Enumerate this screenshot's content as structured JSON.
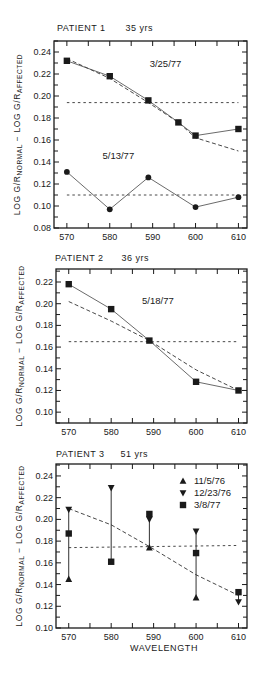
{
  "chart_data": [
    {
      "type": "line",
      "title": "PATIENT 1   35 yrs",
      "xlabel": "",
      "ylabel": "LOG G/R NORMAL − LOG G/R AFFECTED",
      "xlim": [
        567,
        612
      ],
      "ylim": [
        0.08,
        0.25
      ],
      "x_ticks": [
        570,
        580,
        590,
        600,
        610
      ],
      "y_ticks": [
        0.08,
        0.1,
        0.12,
        0.14,
        0.16,
        0.18,
        0.2,
        0.22,
        0.24
      ],
      "y_tick_labels": [
        "0.08",
        "0.10",
        "0.12",
        "0.14",
        "0.16",
        "0.18",
        "0.20",
        "0.22",
        "0.24"
      ],
      "series": [
        {
          "name": "3/25/77",
          "marker": "square",
          "x": [
            570,
            580,
            589,
            596,
            600,
            610
          ],
          "values": [
            0.232,
            0.218,
            0.196,
            0.176,
            0.164,
            0.17
          ]
        },
        {
          "name": "5/13/77",
          "marker": "circle",
          "x": [
            570,
            580,
            589,
            600,
            610
          ],
          "values": [
            0.131,
            0.097,
            0.126,
            0.099,
            0.108
          ]
        }
      ],
      "fit_lines": [
        {
          "style": "dashed",
          "x": [
            570,
            580,
            589,
            596,
            600,
            610
          ],
          "values": [
            0.234,
            0.216,
            0.194,
            0.176,
            0.162,
            0.15
          ]
        },
        {
          "style": "dotted-horizontal",
          "x": [
            570,
            610
          ],
          "values": [
            0.194,
            0.194
          ]
        },
        {
          "style": "dotted-horizontal",
          "x": [
            570,
            610
          ],
          "values": [
            0.11,
            0.11
          ]
        }
      ],
      "annotations": [
        {
          "text": "3/25/77",
          "x": 593,
          "y": 0.226
        },
        {
          "text": "5/13/77",
          "x": 582,
          "y": 0.143
        }
      ]
    },
    {
      "type": "line",
      "title": "PATIENT 2   36 yrs",
      "xlabel": "",
      "ylabel": "LOG G/R NORMAL − LOG G/R AFFECTED",
      "xlim": [
        567,
        612
      ],
      "ylim": [
        0.09,
        0.232
      ],
      "x_ticks": [
        570,
        580,
        590,
        600,
        610
      ],
      "y_ticks": [
        0.1,
        0.12,
        0.14,
        0.16,
        0.18,
        0.2,
        0.22
      ],
      "y_tick_labels": [
        "0.10",
        "0.12",
        "0.14",
        "0.16",
        "0.18",
        "0.20",
        "0.22"
      ],
      "series": [
        {
          "name": "5/18/77",
          "marker": "square",
          "x": [
            570,
            580,
            589,
            600,
            610
          ],
          "values": [
            0.218,
            0.195,
            0.166,
            0.128,
            0.12
          ]
        }
      ],
      "fit_lines": [
        {
          "style": "dashed",
          "x": [
            570,
            580,
            589,
            600,
            610
          ],
          "values": [
            0.202,
            0.184,
            0.166,
            0.139,
            0.12
          ]
        },
        {
          "style": "dotted-horizontal",
          "x": [
            570,
            610
          ],
          "values": [
            0.165,
            0.165
          ]
        }
      ],
      "annotations": [
        {
          "text": "5/18/77",
          "x": 591,
          "y": 0.2
        }
      ]
    },
    {
      "type": "scatter",
      "title": "PATIENT 3   51 yrs",
      "xlabel": "WAVELENGTH",
      "ylabel": "LOG G/R NORMAL − LOG G/R AFFECTED",
      "xlim": [
        567,
        612
      ],
      "ylim": [
        0.1,
        0.251
      ],
      "x_ticks": [
        570,
        580,
        590,
        600,
        610
      ],
      "y_ticks": [
        0.1,
        0.12,
        0.14,
        0.16,
        0.18,
        0.2,
        0.22,
        0.24
      ],
      "y_tick_labels": [
        "0.10",
        "0.12",
        "0.14",
        "0.16",
        "0.18",
        "0.20",
        "0.22",
        "0.24"
      ],
      "series": [
        {
          "name": "11/5/76",
          "marker": "triangle-up",
          "x": [
            570,
            589,
            600
          ],
          "values": [
            0.145,
            0.174,
            0.128
          ]
        },
        {
          "name": "12/23/76",
          "marker": "triangle-down",
          "x": [
            570,
            580,
            589,
            600,
            610
          ],
          "values": [
            0.209,
            0.229,
            0.2,
            0.189,
            0.124
          ]
        },
        {
          "name": "3/8/77",
          "marker": "square",
          "x": [
            570,
            580,
            589,
            600,
            610
          ],
          "values": [
            0.187,
            0.161,
            0.205,
            0.169,
            0.133
          ]
        }
      ],
      "error_bars": [
        {
          "x": 570,
          "low": 0.145,
          "high": 0.209
        },
        {
          "x": 580,
          "low": 0.161,
          "high": 0.229
        },
        {
          "x": 589,
          "low": 0.174,
          "high": 0.205
        },
        {
          "x": 600,
          "low": 0.128,
          "high": 0.189
        },
        {
          "x": 610,
          "low": 0.124,
          "high": 0.133
        }
      ],
      "fit_lines": [
        {
          "style": "dashed",
          "x": [
            570,
            580,
            589,
            600,
            610
          ],
          "values": [
            0.21,
            0.195,
            0.175,
            0.149,
            0.13
          ]
        },
        {
          "style": "dotted-horizontal",
          "x": [
            570,
            610
          ],
          "values": [
            0.174,
            0.176
          ]
        }
      ],
      "legend": {
        "position": "upper right",
        "entries": [
          {
            "marker": "triangle-up",
            "label": "11/5/76"
          },
          {
            "marker": "triangle-down",
            "label": "12/23/76"
          },
          {
            "marker": "square",
            "label": "3/8/77"
          }
        ]
      }
    }
  ],
  "panels": [
    {
      "title_name": "PATIENT 1",
      "title_age": "35 yrs"
    },
    {
      "title_name": "PATIENT 2",
      "title_age": "36 yrs"
    },
    {
      "title_name": "PATIENT 3",
      "title_age": "51 yrs"
    }
  ],
  "ylabel_parts": {
    "log1": "LOG G/R",
    "sub1": "NORMAL",
    "mid": " − LOG G/R",
    "sub2": "AFFECTED"
  },
  "xlabel": "WAVELENGTH"
}
